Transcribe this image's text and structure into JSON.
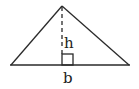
{
  "diagram": {
    "type": "triangle-area-figure",
    "labels": {
      "height": "h",
      "base": "b"
    },
    "colors": {
      "stroke": "#2a2a2a",
      "background": "#ffffff",
      "text": "#222222"
    },
    "geometry": {
      "apex": [
        62,
        6
      ],
      "base_left": [
        11,
        65
      ],
      "base_right": [
        129,
        65
      ],
      "altitude_x": 62,
      "right_angle_marker": {
        "x": 62,
        "y": 54,
        "size": 11
      }
    }
  }
}
